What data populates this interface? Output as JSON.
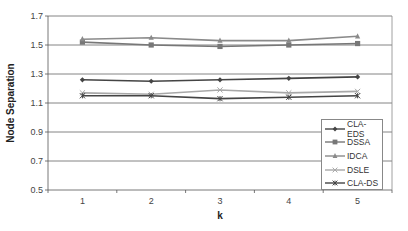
{
  "chart_data": {
    "type": "line",
    "title": "",
    "xlabel": "k",
    "ylabel": "Node Separation",
    "categories": [
      "1",
      "2",
      "3",
      "4",
      "5"
    ],
    "ylim": [
      0.5,
      1.7
    ],
    "yticks": [
      "0.5",
      "0.7",
      "0.9",
      "1.1",
      "1.3",
      "1.5",
      "1.7"
    ],
    "grid": true,
    "legend_position": "lower right inside",
    "series": [
      {
        "name": "CLA-EDS",
        "marker": "diamond",
        "color": "#444444",
        "values": [
          1.26,
          1.25,
          1.26,
          1.27,
          1.28
        ]
      },
      {
        "name": "DSSA",
        "marker": "square",
        "color": "#777777",
        "values": [
          1.52,
          1.5,
          1.49,
          1.5,
          1.51
        ]
      },
      {
        "name": "IDCA",
        "marker": "triangle",
        "color": "#8a8a8a",
        "values": [
          1.54,
          1.55,
          1.53,
          1.53,
          1.56
        ]
      },
      {
        "name": "DSLE",
        "marker": "x",
        "color": "#a8a8a8",
        "values": [
          1.17,
          1.16,
          1.19,
          1.17,
          1.18
        ]
      },
      {
        "name": "CLA-DS",
        "marker": "star",
        "color": "#444444",
        "values": [
          1.15,
          1.15,
          1.13,
          1.14,
          1.15
        ]
      }
    ]
  }
}
